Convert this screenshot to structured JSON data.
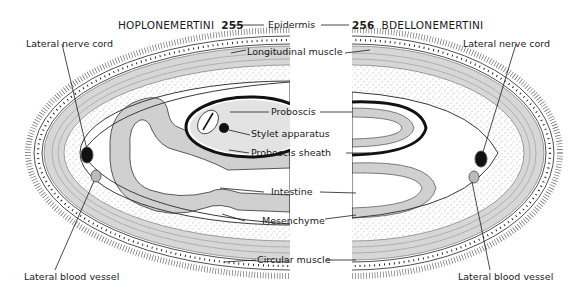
{
  "figure": {
    "left_panel": {
      "title": "HOPLONEMERTINI",
      "figure_number": "255"
    },
    "right_panel": {
      "title": "BDELLONEMERTINI",
      "figure_number": "256"
    }
  },
  "labels": {
    "left_nerve_cord": "Lateral nerve cord",
    "right_nerve_cord": "Lateral nerve cord",
    "left_blood_vessel": "Lateral blood vessel",
    "right_blood_vessel": "Lateral blood vessel",
    "center": [
      "Epidermis",
      "Longitudinal muscle",
      "Proboscis",
      "Stylet apparatus",
      "Proboscis sheath",
      "Intestine",
      "Mesenchyme",
      "Circular muscle"
    ]
  },
  "colors": {
    "ink": "#1a1a1a",
    "background": "#ffffff",
    "muscle": "#8a8a8a"
  }
}
